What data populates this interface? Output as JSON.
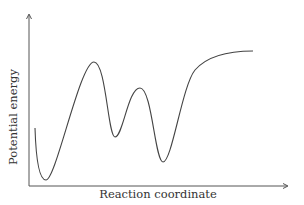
{
  "chart_data": {
    "type": "line",
    "title": "",
    "xlabel": "Reaction coordinate",
    "ylabel": "Potential energy",
    "grid": false,
    "legend": null,
    "axis_ticks": false,
    "x": [
      0.0,
      0.05,
      0.25,
      0.34,
      0.44,
      0.54,
      0.71,
      0.92
    ],
    "values": [
      0.45,
      0.05,
      0.95,
      0.37,
      0.75,
      0.18,
      0.95,
      1.03
    ],
    "features": [
      {
        "name": "initial-wall",
        "x": 0.0,
        "y": 0.45
      },
      {
        "name": "minimum-1",
        "x": 0.05,
        "y": 0.05
      },
      {
        "name": "barrier-1",
        "x": 0.25,
        "y": 0.95
      },
      {
        "name": "minimum-2",
        "x": 0.34,
        "y": 0.37
      },
      {
        "name": "barrier-2",
        "x": 0.44,
        "y": 0.75
      },
      {
        "name": "minimum-3",
        "x": 0.54,
        "y": 0.18
      },
      {
        "name": "plateau",
        "x": 0.92,
        "y": 1.03
      }
    ],
    "path_px": "M35,128 C36,160 39,180 46,180 C56,180 80,62 94,62 C106,62 108,137 115,137 C123,137 128,88 140,88 C152,88 155,162 163,162 C172,162 182,86 195,70 C208,55 230,51 253,51",
    "axis_color": "#555555",
    "curve_color": "#444444"
  },
  "labels": {
    "x_axis": "Reaction coordinate",
    "y_axis": "Potential energy"
  }
}
